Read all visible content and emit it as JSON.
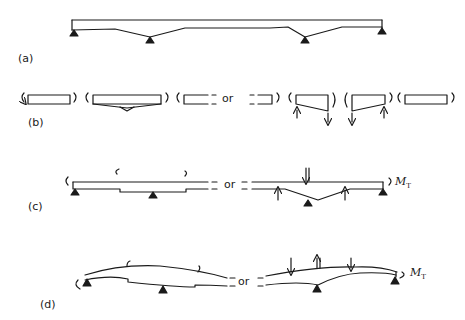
{
  "figure": {
    "panels": [
      {
        "id": "a",
        "label": "(a)",
        "description": "Continuous four-support beam with haunched (tapered) soffit over interior supports"
      },
      {
        "id": "b",
        "label": "(b)",
        "description": "Free-body segments of the beam with end moments and shear reactions",
        "or_text": "or"
      },
      {
        "id": "c",
        "label": "(c)",
        "description": "Stepped beam segment with end moments; alternative with point loads and reactions",
        "or_text": "or",
        "moment_label": "M",
        "moment_subscript": "T"
      },
      {
        "id": "d",
        "label": "(d)",
        "description": "Deflected shapes of the beam segments under the loading",
        "or_text": "or",
        "moment_label": "M",
        "moment_subscript": "T"
      }
    ]
  },
  "colors": {
    "ink": "#1a1a1a",
    "background": "#ffffff"
  }
}
